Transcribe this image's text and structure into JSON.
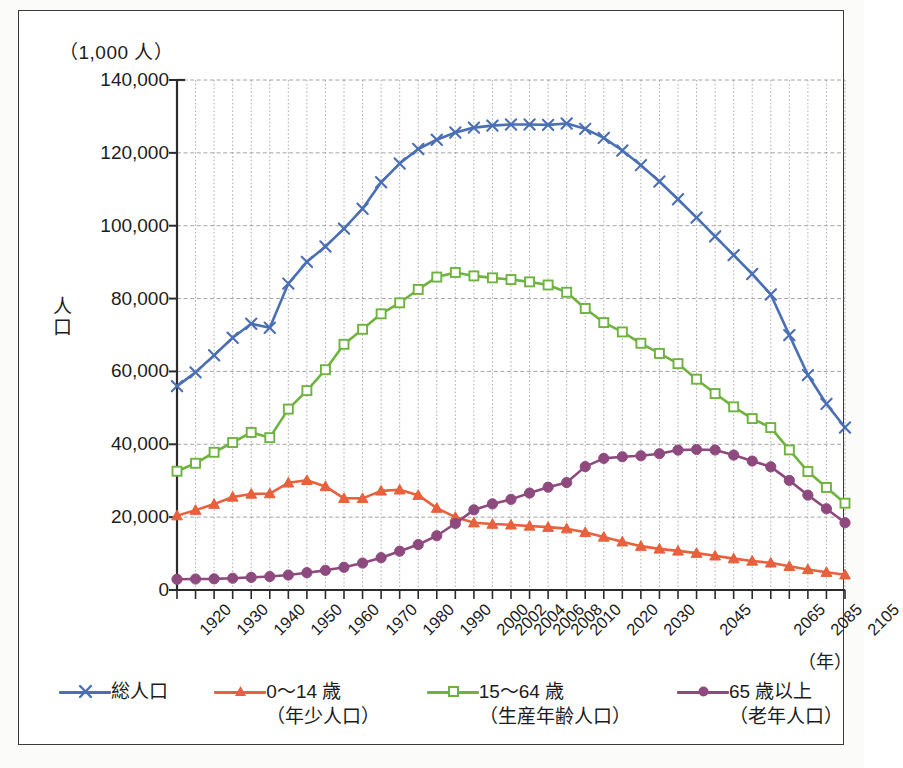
{
  "axis": {
    "unit_label": "（1,000 人）",
    "y_title": "人口",
    "x_unit": "（年）",
    "y_ticks": [
      "140,000",
      "120,000",
      "100,000",
      "80,000",
      "60,000",
      "40,000",
      "20,000",
      "0"
    ]
  },
  "legend": {
    "items": [
      {
        "name": "total-population",
        "label": "総人口",
        "label2": "",
        "color": "#4a6fb5",
        "marker": "cross"
      },
      {
        "name": "young-population",
        "label": "0〜14 歳",
        "label2": "（年少人口）",
        "color": "#e8603c",
        "marker": "triangle"
      },
      {
        "name": "working-age-population",
        "label": "15〜64 歳",
        "label2": "（生産年齢人口）",
        "color": "#6fb33f",
        "marker": "square"
      },
      {
        "name": "elderly-population",
        "label": "65 歳以上",
        "label2": "（老年人口）",
        "color": "#8e4a7e",
        "marker": "circle"
      }
    ]
  },
  "chart_data": {
    "type": "line",
    "title": "",
    "xlabel": "（年）",
    "ylabel": "人口",
    "unit": "（1,000 人）",
    "ylim": [
      0,
      140000
    ],
    "ytick_step": 20000,
    "grid": true,
    "legend_position": "bottom",
    "categories": [
      "1920",
      "1925",
      "1930",
      "1935",
      "1940",
      "1945",
      "1950",
      "1955",
      "1960",
      "1965",
      "1970",
      "1975",
      "1980",
      "1985",
      "1990",
      "1995",
      "2000",
      "2002",
      "2004",
      "2006",
      "2008",
      "2010",
      "2015",
      "2020",
      "2025",
      "2030",
      "2035",
      "2040",
      "2045",
      "2050",
      "2055",
      "2060",
      "2065",
      "2075",
      "2085",
      "2095",
      "2105"
    ],
    "tick_labels": [
      "1920",
      "",
      "1930",
      "",
      "1940",
      "",
      "1950",
      "",
      "1960",
      "",
      "1970",
      "",
      "1980",
      "",
      "1990",
      "",
      "2000",
      "2002",
      "2004",
      "2006",
      "2008",
      "2010",
      "",
      "2020",
      "",
      "2030",
      "",
      "",
      "2045",
      "",
      "",
      "",
      "2065",
      "",
      "2085",
      "",
      "2105"
    ],
    "series": [
      {
        "name": "総人口",
        "color": "#4a6fb5",
        "marker": "cross",
        "values": [
          55963,
          59737,
          64450,
          69254,
          73075,
          71998,
          84115,
          90077,
          94302,
          99209,
          104665,
          111940,
          117060,
          121049,
          123611,
          125570,
          126926,
          127486,
          127787,
          127770,
          127692,
          128057,
          126597,
          124100,
          120659,
          116618,
          112124,
          107276,
          102210,
          97076,
          91933,
          86737,
          81135,
          69959,
          59001,
          51080,
          44592
        ],
        "ylim_note": "plateau ~128,000 from 1995 to 2010"
      },
      {
        "name": "0〜14 歳（年少人口）",
        "color": "#e8603c",
        "marker": "triangle",
        "values": [
          20416,
          21924,
          23579,
          25545,
          26369,
          26477,
          29428,
          30123,
          28434,
          25166,
          25153,
          27221,
          27507,
          26033,
          22486,
          20014,
          18472,
          18102,
          17890,
          17585,
          17247,
          16839,
          15827,
          14568,
          13240,
          12039,
          11287,
          10732,
          10116,
          9387,
          8614,
          7975,
          7462,
          6525,
          5650,
          4890,
          4196
        ]
      },
      {
        "name": "15〜64 歳（生産年齢人口）",
        "color": "#6fb33f",
        "marker": "square",
        "values": [
          32605,
          34792,
          37807,
          40484,
          43252,
          41821,
          49658,
          54729,
          60469,
          67444,
          71566,
          75807,
          78835,
          82506,
          85904,
          87165,
          86220,
          85687,
          85220,
          84587,
          83731,
          81735,
          77282,
          73408,
          70845,
          67730,
          64942,
          62133,
          57866,
          53933,
          50276,
          47063,
          44590,
          38455,
          32530,
          28150,
          23830
        ]
      },
      {
        "name": "65 歳以上（老年人口）",
        "color": "#8e4a7e",
        "marker": "circle",
        "values": [
          2941,
          3021,
          3064,
          3225,
          3454,
          3700,
          4109,
          4747,
          5398,
          6236,
          7393,
          8865,
          10647,
          12468,
          14895,
          18261,
          22005,
          23628,
          24876,
          26604,
          28216,
          29484,
          33868,
          36124,
          36573,
          36849,
          37407,
          38406,
          38564,
          38428,
          37042,
          35403,
          33810,
          30085,
          26040,
          22300,
          18470
        ]
      }
    ]
  }
}
